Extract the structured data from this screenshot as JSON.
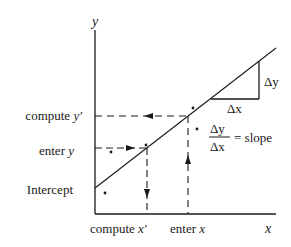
{
  "diagram": {
    "type": "linear-regression-explainer",
    "axes": {
      "y_label": "y",
      "x_label": "x"
    },
    "y_labels": {
      "compute_y_prefix": "compute ",
      "compute_y_var": "y′",
      "enter_y_prefix": "enter ",
      "enter_y_var": "y",
      "intercept": "Intercept"
    },
    "x_labels": {
      "compute_x_prefix": "compute ",
      "compute_x_var": "x′",
      "enter_x_prefix": "enter ",
      "enter_x_var": "x"
    },
    "slope_triangle": {
      "delta_y": "Δy",
      "delta_x": "Δx"
    },
    "slope_formula": {
      "numerator": "Δy",
      "denominator": "Δx",
      "equals": "= slope"
    },
    "colors": {
      "ink": "#1a1a1a",
      "background": "#ffffff"
    }
  }
}
